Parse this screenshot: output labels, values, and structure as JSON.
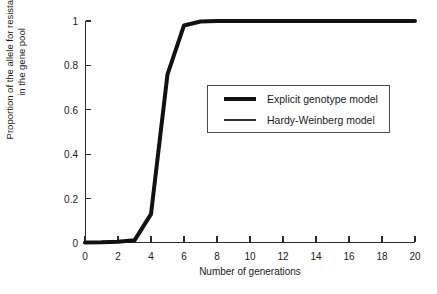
{
  "chart_data": {
    "type": "line",
    "title": "",
    "xlabel": "Number of generations",
    "ylabel_line1": "Proportion of the allele for resistance",
    "ylabel_line2": "in the gene pool",
    "xlim": [
      0,
      20
    ],
    "ylim": [
      0,
      1
    ],
    "xticks": [
      0,
      2,
      4,
      6,
      8,
      10,
      12,
      14,
      16,
      18,
      20
    ],
    "xticklabels": [
      "0",
      "2",
      "4",
      "6",
      "8",
      "10",
      "12",
      "14",
      "16",
      "18",
      "20"
    ],
    "yticks": [
      0,
      0.2,
      0.4,
      0.6,
      0.8,
      1
    ],
    "yticklabels": [
      "0",
      "0.2",
      "0.4",
      "0.6",
      "0.8",
      "1"
    ],
    "grid": false,
    "legend_position": "center-right",
    "x": [
      0,
      1,
      2,
      3,
      4,
      5,
      6,
      7,
      8,
      9,
      10,
      11,
      12,
      13,
      14,
      15,
      16,
      17,
      18,
      19,
      20
    ],
    "series": [
      {
        "name": "Explicit genotype model",
        "style": "thick",
        "color": "#111111",
        "linewidth": 4,
        "values": [
          0.002,
          0.003,
          0.006,
          0.012,
          0.13,
          0.76,
          0.98,
          0.998,
          1.0,
          1.0,
          1.0,
          1.0,
          1.0,
          1.0,
          1.0,
          1.0,
          1.0,
          1.0,
          1.0,
          1.0,
          1.0
        ]
      },
      {
        "name": "Hardy-Weinberg model",
        "style": "thin",
        "color": "#333333",
        "linewidth": 1,
        "values": [
          0.002,
          0.003,
          0.006,
          0.012,
          0.13,
          0.76,
          0.98,
          0.998,
          1.0,
          1.0,
          1.0,
          1.0,
          1.0,
          1.0,
          1.0,
          1.0,
          1.0,
          1.0,
          1.0,
          1.0,
          1.0
        ]
      }
    ],
    "legend": [
      {
        "label": "Explicit genotype model",
        "style": "thick"
      },
      {
        "label": "Hardy-Weinberg model",
        "style": "thin"
      }
    ],
    "axis_color": "#2b2b2b",
    "background": "#ffffff"
  }
}
